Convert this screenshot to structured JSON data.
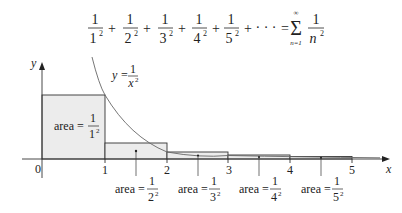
{
  "formula": {
    "terms": [
      {
        "num": "1",
        "den": "1",
        "exp": "2"
      },
      {
        "num": "1",
        "den": "2",
        "exp": "2"
      },
      {
        "num": "1",
        "den": "3",
        "exp": "2"
      },
      {
        "num": "1",
        "den": "4",
        "exp": "2"
      },
      {
        "num": "1",
        "den": "5",
        "exp": "2"
      }
    ],
    "plus": "+",
    "ellipsis": "· · ·",
    "equals": "=",
    "sigma": "Σ",
    "sigma_upper": "∞",
    "sigma_lower": "n=1",
    "sum_num": "1",
    "sum_den": "n",
    "sum_exp": "2"
  },
  "axes": {
    "x_label": "x",
    "y_label": "y",
    "origin_label": "0",
    "x_ticks": [
      "1",
      "2",
      "3",
      "4",
      "5"
    ]
  },
  "curve": {
    "label_lhs": "y =",
    "label_num": "1",
    "label_den": "x",
    "label_exp": "2"
  },
  "areas": {
    "prefix": "area =",
    "labels": [
      {
        "num": "1",
        "den": "1",
        "exp": "2"
      },
      {
        "num": "1",
        "den": "2",
        "exp": "2"
      },
      {
        "num": "1",
        "den": "3",
        "exp": "2"
      },
      {
        "num": "1",
        "den": "4",
        "exp": "2"
      },
      {
        "num": "1",
        "den": "5",
        "exp": "2"
      }
    ]
  },
  "colors": {
    "fill": "#ececec",
    "stroke": "#333333",
    "curve": "#666666"
  }
}
